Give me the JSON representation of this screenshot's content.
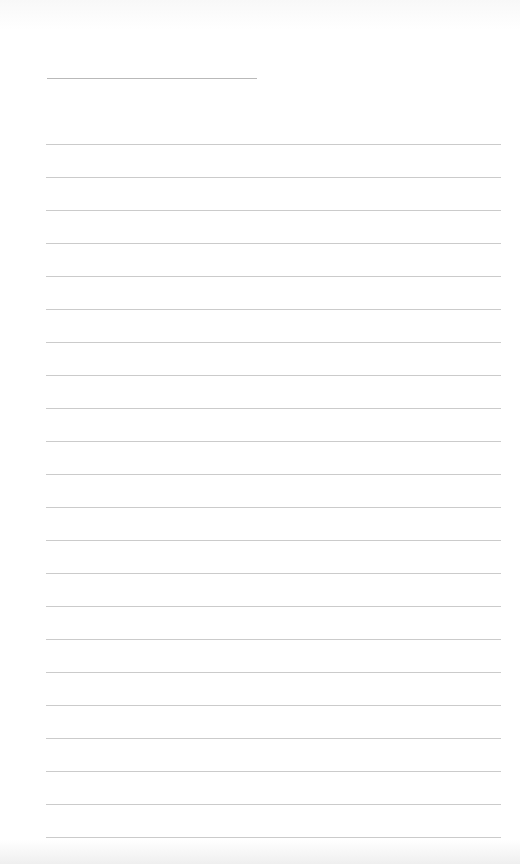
{
  "page": {
    "type": "lined-paper",
    "background": "#ffffff",
    "line_color": "#cbcbcb",
    "short_line_color": "#b9b9b9",
    "short_line": {
      "x1": 47,
      "x2": 257,
      "y": 78
    },
    "full_lines": {
      "x1": 46,
      "x2": 501,
      "start_y": 144,
      "spacing": 33,
      "count": 22
    }
  }
}
